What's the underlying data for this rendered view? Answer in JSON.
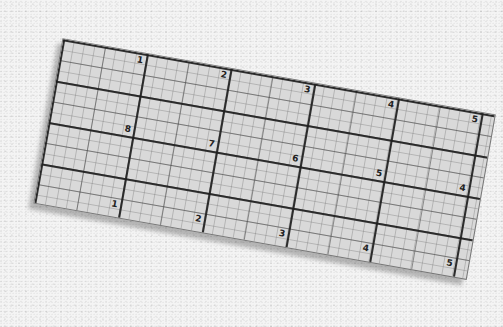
{
  "scene": {
    "description": "Photo of a transparent grid quilting ruler on a speckled white surface",
    "background_color": "#f4f4f4",
    "ruler_color": "#d9d9d9",
    "line_color": "#1e1e1e"
  },
  "ruler": {
    "row_top_numbers": [
      "1",
      "2",
      "3",
      "4",
      "5"
    ],
    "row_middle_numbers": [
      "8",
      "7",
      "6",
      "5",
      "4"
    ],
    "row_bottom_numbers": [
      "1",
      "2",
      "3",
      "4",
      "5"
    ]
  }
}
